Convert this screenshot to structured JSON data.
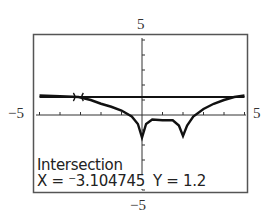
{
  "window": {
    "ymax_label": "5",
    "ymin_label": "−5",
    "xmin_label": "−5",
    "xmax_label": "5"
  },
  "status": {
    "title": "Intersection",
    "x_readout": "X = ⁻3.104745",
    "y_readout": "Y = 1.2"
  },
  "chart_data": {
    "type": "line",
    "title": "",
    "xlabel": "",
    "ylabel": "",
    "xlim": [
      -5,
      5
    ],
    "ylim": [
      -5,
      5
    ],
    "xscl": 1,
    "yscl": 1,
    "grid": false,
    "series": [
      {
        "name": "horizontal line",
        "x": [
          -5,
          5
        ],
        "y": [
          1.2,
          1.2
        ]
      },
      {
        "name": "curve with cusps",
        "x": [
          -5,
          -4,
          -3.1,
          -2.5,
          -2,
          -1.5,
          -1,
          -0.5,
          -0.2,
          0,
          0.2,
          0.5,
          1,
          1.5,
          1.8,
          2,
          2.2,
          2.5,
          3,
          3.5,
          4,
          4.5,
          5
        ],
        "y": [
          1.3,
          1.25,
          1.2,
          1.0,
          0.75,
          0.55,
          0.3,
          -0.1,
          -0.6,
          -1.5,
          -0.6,
          -0.3,
          -0.35,
          -0.35,
          -0.7,
          -1.4,
          -0.7,
          -0.1,
          0.4,
          0.75,
          1.0,
          1.2,
          1.3
        ]
      }
    ],
    "annotations": [
      {
        "type": "intersection-marker",
        "x": -3.104745,
        "y": 1.2
      }
    ],
    "readout": {
      "label": "Intersection",
      "x": -3.104745,
      "y": 1.2
    }
  }
}
